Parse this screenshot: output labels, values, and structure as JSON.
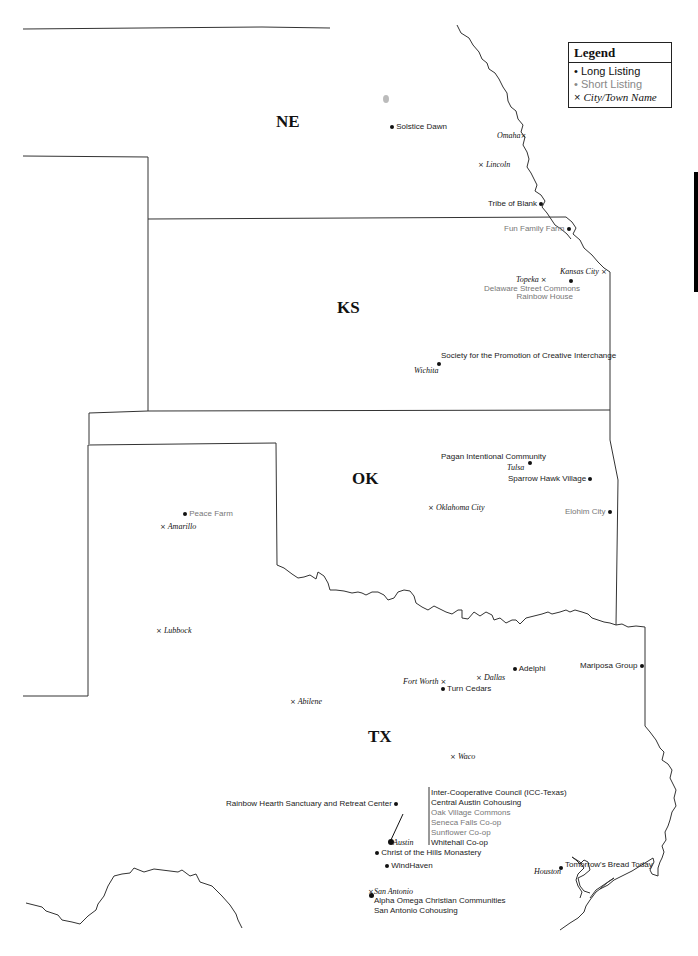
{
  "legend": {
    "title": "Legend",
    "items": [
      {
        "symbol": "•",
        "label": "Long Listing",
        "kind": "long"
      },
      {
        "symbol": "•",
        "label": "Short Listing",
        "kind": "short"
      },
      {
        "symbol": "×",
        "label": "City/Town Name",
        "kind": "city"
      }
    ]
  },
  "states": {
    "ne": "NE",
    "ks": "KS",
    "ok": "OK",
    "tx": "TX"
  },
  "cities": {
    "omaha": "Omaha",
    "lincoln": "Lincoln",
    "topeka": "Topeka",
    "kansas_city": "Kansas City",
    "wichita": "Wichita",
    "tulsa": "Tulsa",
    "oklahoma_city": "Oklahoma City",
    "amarillo": "Amarillo",
    "lubbock": "Lubbock",
    "fort_worth": "Fort Worth",
    "dallas": "Dallas",
    "abilene": "Abilene",
    "waco": "Waco",
    "austin": "Austin",
    "san_antonio": "San Antonio",
    "houston": "Houston"
  },
  "communities": {
    "solstice_dawn": "Solstice Dawn",
    "tribe_of_blank": "Tribe of Blank",
    "fun_family_farm": "Fun Family Farm",
    "delaware_street_commons": "Delaware Street Commons",
    "rainbow_house": "Rainbow House",
    "society_promotion": "Society for the Promotion of Creative Interchange",
    "pagan_intentional": "Pagan Intentional Community",
    "sparrow_hawk": "Sparrow Hawk Village",
    "elohim_city": "Elohim City",
    "peace_farm": "Peace Farm",
    "adelphi": "Adelphi",
    "turn_cedars": "Turn Cedars",
    "mariposa_group": "Mariposa Group",
    "rainbow_hearth": "Rainbow Hearth Sanctuary and Retreat Center",
    "austin_list": [
      {
        "label": "Inter-Cooperative Council (ICC-Texas)",
        "kind": "long"
      },
      {
        "label": "Central Austin Cohousing",
        "kind": "long"
      },
      {
        "label": "Oak Village Commons",
        "kind": "short"
      },
      {
        "label": "Seneca Falls Co-op",
        "kind": "short"
      },
      {
        "label": "Sunflower Co-op",
        "kind": "short"
      },
      {
        "label": "Whitehall Co-op",
        "kind": "long"
      }
    ],
    "christ_of_the_hills": "Christ of the Hills Monastery",
    "windhaven": "WindHaven",
    "alpha_omega": "Alpha Omega Christian Communities",
    "san_antonio_cohousing": "San Antonio Cohousing",
    "tomorrows_bread": "Tomorrow's Bread Today"
  },
  "colors": {
    "border": "#333333",
    "long_listing": "#1a1a1a",
    "short_listing": "#777777"
  }
}
